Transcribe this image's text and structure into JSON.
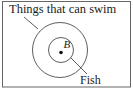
{
  "diagram": {
    "type": "euler-diagram",
    "outer_set": {
      "label": "Things that can swim"
    },
    "inner_set": {
      "label": "Fish"
    },
    "point": {
      "label": "B"
    },
    "colors": {
      "stroke": "#333333",
      "text": "#222222",
      "background": "#ffffff"
    }
  }
}
